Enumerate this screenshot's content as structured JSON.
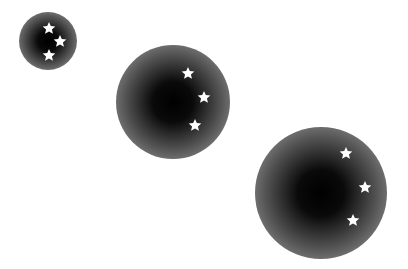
{
  "scene": {
    "background": "#ffffff",
    "orbs": [
      {
        "cx": 48,
        "cy": 41,
        "r": 29,
        "stars": [
          [
            49,
            28
          ],
          [
            60,
            41
          ],
          [
            49,
            55
          ]
        ]
      },
      {
        "cx": 173,
        "cy": 102,
        "r": 57,
        "stars": [
          [
            188,
            73
          ],
          [
            204,
            97
          ],
          [
            195,
            125
          ]
        ]
      },
      {
        "cx": 321,
        "cy": 193,
        "r": 66,
        "stars": [
          [
            346,
            153
          ],
          [
            365,
            187
          ],
          [
            353,
            220
          ]
        ]
      }
    ],
    "orb_colors": {
      "center": "#000000",
      "edge": "#b0b0b0"
    },
    "star_color": "#ffffff"
  }
}
